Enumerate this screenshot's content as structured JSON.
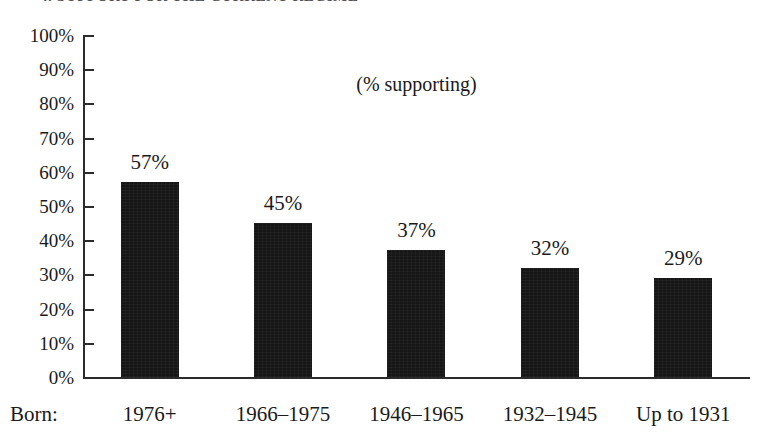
{
  "title": "4. SUPPORT FOR THE CURRENT REGIME",
  "axis_row_label": "Born:",
  "chart_data": {
    "type": "bar",
    "title": "4. SUPPORT FOR THE CURRENT REGIME",
    "annotation": "(% supporting)",
    "xlabel": "Born:",
    "ylabel": "",
    "ylim": [
      0,
      100
    ],
    "grid": false,
    "legend": "none",
    "orientation": "vertical",
    "bar_color": "#161616",
    "axis_color": "#2b2b2b",
    "background": "#ffffff",
    "categories": [
      "1976+",
      "1966–1975",
      "1946–1965",
      "1932–1945",
      "Up to 1931"
    ],
    "values": [
      57,
      45,
      37,
      32,
      29
    ],
    "value_labels": [
      "57%",
      "45%",
      "37%",
      "32%",
      "29%"
    ],
    "yticks": [
      0,
      10,
      20,
      30,
      40,
      50,
      60,
      70,
      80,
      90,
      100
    ],
    "ytick_labels": [
      "0%",
      "10%",
      "20%",
      "30%",
      "40%",
      "50%",
      "60%",
      "70%",
      "80%",
      "90%",
      "100%"
    ]
  }
}
